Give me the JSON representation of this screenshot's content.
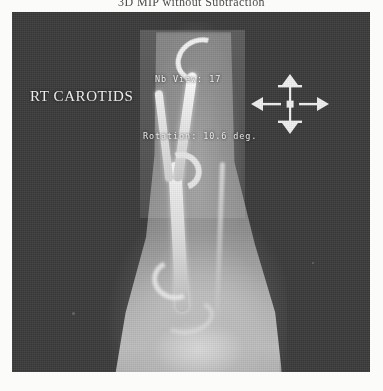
{
  "page": {
    "title": "3D MIP without Subtraction"
  },
  "viewer": {
    "name": "angiography-mip-viewer",
    "background_color": "#3a3a3a",
    "study_label": "RT CAROTIDS",
    "overlays": {
      "nb_view": "Nb View: 17",
      "rotation": "Rotation: 10.6 deg."
    },
    "roi": {
      "name": "bright-subvolume-rectangle",
      "highlight_color": "#ffffff"
    },
    "anatomy": {
      "name": "right-carotid-artery-mip",
      "vessels": [
        "common-carotid-trunk",
        "internal-carotid-artery",
        "external-carotid-artery",
        "carotid-bulb-bifurcation",
        "distal-arch",
        "vertebral-parallel-vessel"
      ]
    },
    "dpad": {
      "name": "pan-rotate-control",
      "up_label": "up-arrow",
      "down_label": "down-arrow",
      "left_label": "left-arrow",
      "right_label": "right-arrow",
      "center_label": "center-handle",
      "color": "#f0f0f0"
    }
  }
}
